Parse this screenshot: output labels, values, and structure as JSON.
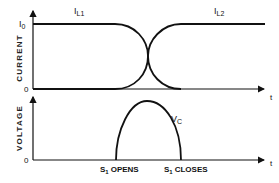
{
  "top_plot": {
    "y_axis_label": "CURRENT",
    "y_tick_top": "I",
    "y_tick_top_sub": "0",
    "y_tick_bottom": "0",
    "x_axis_label": "t",
    "curve1_label": "I",
    "curve1_sub": "L1",
    "curve2_label": "I",
    "curve2_sub": "L2"
  },
  "bottom_plot": {
    "y_axis_label": "VOLTAGE",
    "y_tick_bottom": "0",
    "x_axis_label": "t",
    "curve_label": "V",
    "curve_sub": "C",
    "event1_label": "S",
    "event1_sub": "1",
    "event1_text": "OPENS",
    "event2_label": "S",
    "event2_sub": "1",
    "event2_text": "CLOSES"
  },
  "colors": {
    "line": "#111111",
    "background": "#ffffff"
  }
}
